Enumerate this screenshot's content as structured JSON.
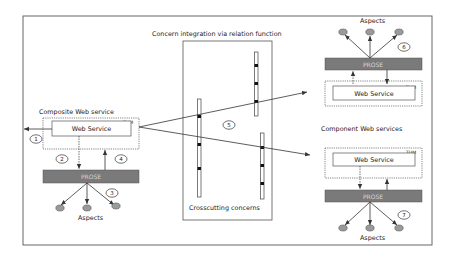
{
  "diagram": {
    "title": "Concern integration via relation function",
    "composite": {
      "label": "Composite Web service",
      "web_service_label": "Web Service",
      "tag": "TUM",
      "prose_label": "PROSE",
      "aspects_label": "Aspects"
    },
    "component_top": {
      "aspects_label": "Aspects",
      "prose_label": "PROSE",
      "web_service_label": "Web Service",
      "tag": "TUM"
    },
    "component_label": "Component Web services",
    "component_bottom": {
      "web_service_label": "Web Service",
      "tag": "TUM",
      "prose_label": "PROSE",
      "aspects_label": "Aspects"
    },
    "crosscutting_label": "Crosscutting concerns",
    "step_numbers": [
      "1",
      "2",
      "3",
      "4",
      "5",
      "6",
      "7"
    ],
    "colors": {
      "frame": "#666666",
      "prose_fill": "#7a7a7a",
      "aspect_fill": "#9a9a9a",
      "line": "#333333"
    }
  }
}
